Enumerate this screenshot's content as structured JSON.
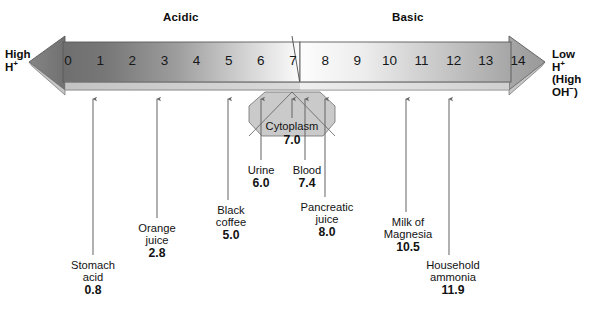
{
  "figure": {
    "regions": {
      "acidic_label": "Acidic",
      "basic_label": "Basic"
    },
    "ends": {
      "left": {
        "line1": "High",
        "line2": "H",
        "line2_sup": "+"
      },
      "right": {
        "line1": "Low",
        "line2": "H",
        "line2_sup": "+",
        "line3": "(High",
        "line4": "OH",
        "line4_sup": "−",
        "line4_tail": ")"
      }
    },
    "scale": {
      "ticks": [
        "0",
        "1",
        "2",
        "3",
        "4",
        "5",
        "6",
        "7",
        "8",
        "9",
        "10",
        "11",
        "12",
        "13",
        "14"
      ],
      "min": 0,
      "max": 14,
      "neutral": 7
    },
    "colors": {
      "acid_dark": "#7c7c7c",
      "neutral_white": "#fdfdfd",
      "base_gray": "#aaaaaa",
      "bar_outline": "#4a4a4a",
      "shadow_strip": "#d7d7d7",
      "cytoplasm_fill": "#c9c9c9",
      "pointer": "#6a6a6a",
      "text": "#121212"
    },
    "cytoplasm": {
      "name": "Cytoplasm",
      "value": "7.0",
      "ph": 7.0
    },
    "callouts": [
      {
        "name_line1": "Stomach",
        "name_line2": "acid",
        "value": "0.8",
        "ph": 0.8
      },
      {
        "name_line1": "Orange",
        "name_line2": "juice",
        "value": "2.8",
        "ph": 2.8
      },
      {
        "name_line1": "Black",
        "name_line2": "coffee",
        "value": "5.0",
        "ph": 5.0
      },
      {
        "name_line1": "Urine",
        "name_line2": "",
        "value": "6.0",
        "ph": 6.0
      },
      {
        "name_line1": "Blood",
        "name_line2": "",
        "value": "7.4",
        "ph": 7.4
      },
      {
        "name_line1": "Pancreatic",
        "name_line2": "juice",
        "value": "8.0",
        "ph": 8.0
      },
      {
        "name_line1": "Milk of",
        "name_line2": "Magnesia",
        "value": "10.5",
        "ph": 10.5
      },
      {
        "name_line1": "Household",
        "name_line2": "ammonia",
        "value": "11.9",
        "ph": 11.9
      }
    ]
  },
  "chart_data": {
    "type": "bar",
    "xlabel": "pH",
    "ylabel": "",
    "xlim": [
      0,
      14
    ],
    "categories": [
      "Stomach acid",
      "Orange juice",
      "Black coffee",
      "Urine",
      "Cytoplasm",
      "Blood",
      "Pancreatic juice",
      "Milk of Magnesia",
      "Household ammonia"
    ],
    "values": [
      0.8,
      2.8,
      5.0,
      6.0,
      7.0,
      7.4,
      8.0,
      10.5,
      11.9
    ],
    "tick_labels": [
      "0",
      "1",
      "2",
      "3",
      "4",
      "5",
      "6",
      "7",
      "8",
      "9",
      "10",
      "11",
      "12",
      "13",
      "14"
    ],
    "annotations": [
      "Acidic",
      "Basic",
      "High H+",
      "Low H+ (High OH-)"
    ],
    "grid": false,
    "legend": "none"
  }
}
